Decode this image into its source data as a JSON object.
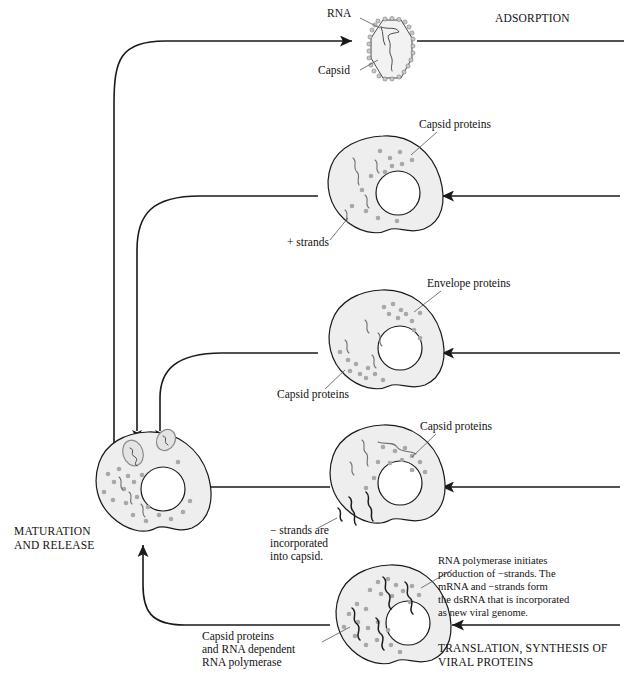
{
  "figure": {
    "folio": "",
    "stages": {
      "adsorption": "ADSORPTION",
      "maturation_line1": "MATURATION",
      "maturation_line2": "AND RELEASE",
      "translation_line1": "TRANSLATION, SYNTHESIS OF",
      "translation_line2": "VIRAL PROTEINS"
    },
    "labels": {
      "rna": "RNA",
      "capsid": "Capsid",
      "capsid_proteins_1": "Capsid proteins",
      "plus_strands": "+ strands",
      "envelope_proteins": "Envelope proteins",
      "capsid_proteins_2": "Capsid proteins",
      "capsid_proteins_3": "Capsid proteins",
      "minus_strands_line1": "− strands are",
      "minus_strands_line2": "incorporated",
      "minus_strands_line3": "into capsid.",
      "polymerase_line1": "Capsid proteins",
      "polymerase_line2": "and RNA dependent",
      "polymerase_line3": "RNA polymerase"
    },
    "note": {
      "line1": "RNA polymerase initiates",
      "line2": "production of −strands. The",
      "line3": "mRNA and −strands form",
      "line4": "the dsRNA that is incorporated",
      "line5": "as new viral genome."
    },
    "colors": {
      "cytoplasm": "#eeeeee",
      "outline": "#1a1a1a",
      "nucleus": "#ffffff",
      "protein_dot": "#a8a8a8",
      "strand": "#6f6f6f",
      "strand_dark": "#1a1a1a",
      "background": "#ffffff"
    }
  }
}
